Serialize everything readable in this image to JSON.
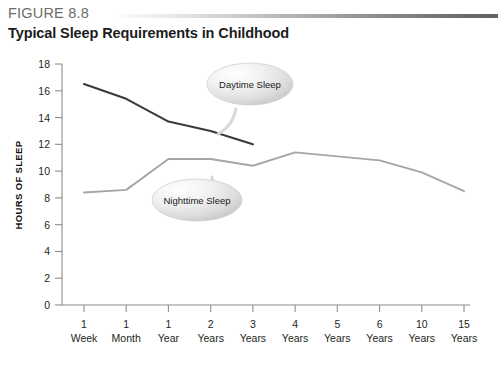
{
  "figure": {
    "number_label": "FIGURE 8.8",
    "title": "Typical Sleep Requirements in Childhood"
  },
  "chart_data": {
    "type": "line",
    "title": "Typical Sleep Requirements in Childhood",
    "xlabel": "",
    "ylabel": "HOURS OF SLEEP",
    "ylim": [
      0,
      18
    ],
    "ytick_step": 2,
    "yticks": [
      "0",
      "2",
      "4",
      "6",
      "8",
      "10",
      "12",
      "14",
      "16",
      "18"
    ],
    "grid": false,
    "legend": "annotated-callouts",
    "categories": [
      "1 Week",
      "1 Month",
      "1 Year",
      "2 Years",
      "3 Years",
      "4 Years",
      "5 Years",
      "6 Years",
      "10 Years",
      "15 Years"
    ],
    "xtick_top": [
      "1",
      "1",
      "1",
      "2",
      "3",
      "4",
      "5",
      "6",
      "10",
      "15"
    ],
    "xtick_bottom": [
      "Week",
      "Month",
      "Year",
      "Years",
      "Years",
      "Years",
      "Years",
      "Years",
      "Years",
      "Years"
    ],
    "series": [
      {
        "name": "Daytime Sleep",
        "color": "#3a3a3a",
        "values": [
          16.5,
          15.4,
          13.7,
          13.0,
          12.0,
          null,
          null,
          null,
          null,
          null
        ]
      },
      {
        "name": "Nighttime Sleep",
        "color": "#a6a6a6",
        "values": [
          8.4,
          8.6,
          10.9,
          10.9,
          10.4,
          11.4,
          11.1,
          10.8,
          9.9,
          8.5
        ]
      }
    ],
    "annotations": [
      {
        "label": "Daytime Sleep",
        "attached_to": "Daytime Sleep"
      },
      {
        "label": "Nighttime Sleep",
        "attached_to": "Nighttime Sleep"
      }
    ]
  }
}
